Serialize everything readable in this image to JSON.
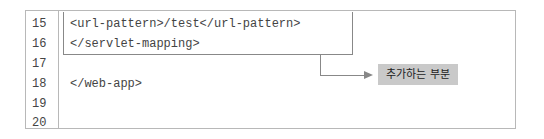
{
  "code_listing": {
    "lines": [
      {
        "number": "15",
        "code": "<url-pattern>/test</url-pattern>"
      },
      {
        "number": "16",
        "code": "</servlet-mapping>"
      },
      {
        "number": "17",
        "code": ""
      },
      {
        "number": "18",
        "code": "</web-app>"
      },
      {
        "number": "19",
        "code": ""
      },
      {
        "number": "20",
        "code": ""
      }
    ]
  },
  "annotation": {
    "label": "추가하는 부분"
  }
}
